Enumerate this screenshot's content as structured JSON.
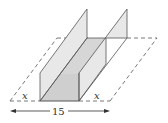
{
  "diagram": {
    "labels": {
      "left_fold": "x",
      "right_fold": "x",
      "width": "15"
    },
    "colors": {
      "line": "#555555",
      "wall_fill": "#e6e6e6",
      "base_fill": "#cfcfcf",
      "dashed": "#555555"
    }
  }
}
